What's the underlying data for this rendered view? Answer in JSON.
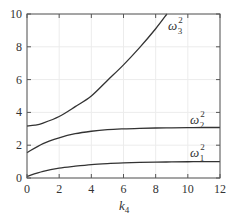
{
  "chart_data": {
    "type": "line",
    "title": "",
    "xlabel": "k4",
    "xlabel_base": "k",
    "xlabel_sub": "4",
    "ylabel": "",
    "xlim": [
      0,
      12
    ],
    "ylim": [
      0,
      10
    ],
    "grid": true,
    "xticks": [
      0,
      2,
      4,
      6,
      8,
      10,
      12
    ],
    "yticks": [
      0,
      2,
      4,
      6,
      8,
      10
    ],
    "series": [
      {
        "name": "ω1²",
        "label_base": "ω",
        "label_sub": "1",
        "label_sup": "2",
        "x": [
          0,
          1,
          2,
          3,
          4,
          5,
          6,
          7,
          8,
          9,
          10,
          11,
          12
        ],
        "values": [
          0.1,
          0.4,
          0.6,
          0.72,
          0.82,
          0.88,
          0.92,
          0.95,
          0.97,
          0.98,
          0.99,
          1.0,
          1.0
        ]
      },
      {
        "name": "ω2²",
        "label_base": "ω",
        "label_sub": "2",
        "label_sup": "2",
        "x": [
          0,
          1,
          2,
          3,
          4,
          5,
          6,
          7,
          8,
          9,
          10,
          11,
          12
        ],
        "values": [
          1.55,
          2.1,
          2.45,
          2.7,
          2.85,
          2.95,
          3.0,
          3.03,
          3.05,
          3.06,
          3.07,
          3.08,
          3.08
        ]
      },
      {
        "name": "ω3²",
        "label_base": "ω",
        "label_sub": "3",
        "label_sup": "2",
        "x": [
          0,
          0.5,
          1,
          2,
          3,
          4,
          5,
          6,
          7,
          8,
          8.7
        ],
        "values": [
          3.17,
          3.22,
          3.35,
          3.75,
          4.35,
          5.0,
          5.95,
          6.9,
          7.95,
          9.1,
          10.0
        ]
      }
    ]
  }
}
